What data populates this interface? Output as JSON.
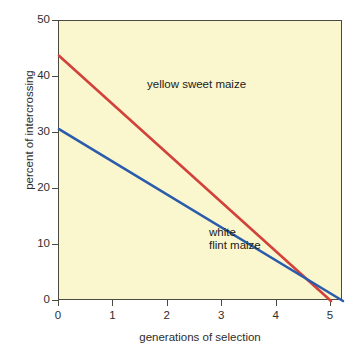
{
  "chart_data": {
    "type": "line",
    "title": "",
    "subtitle": "",
    "xlabel": "generations of selection",
    "ylabel": "percent of intercrossing",
    "xlim": [
      0,
      5.22
    ],
    "ylim": [
      0,
      50
    ],
    "xticks": [
      "0",
      "1",
      "2",
      "3",
      "4",
      "5"
    ],
    "xtick_values": [
      0,
      1,
      2,
      3,
      4,
      5
    ],
    "yticks": [
      "0",
      "10",
      "20",
      "30",
      "40",
      "50"
    ],
    "ytick_values": [
      0,
      10,
      20,
      30,
      40,
      50
    ],
    "grid": false,
    "legend": "inline-annotations",
    "background_color": "#faf6ce",
    "axis_color": "#4a4a42",
    "series": [
      {
        "name": "yellow sweet maize",
        "color": "#d2423a",
        "label_x": 0.55,
        "label_y": 45.0,
        "x": [
          0,
          5.0
        ],
        "values": [
          43.8,
          0
        ]
      },
      {
        "name": "white flint maize",
        "color": "#2b5cab",
        "label_x": 1.7,
        "label_y": 17.0,
        "x": [
          0,
          5.22
        ],
        "values": [
          30.7,
          0
        ]
      }
    ],
    "annotations": [
      {
        "text": "yellow sweet maize",
        "series": "yellow sweet maize"
      },
      {
        "text": "white\nflint maize",
        "series": "white flint maize"
      }
    ]
  },
  "annotations": {
    "yellow_sweet_maize": "yellow sweet maize",
    "white_flint_maize_line1": "white",
    "white_flint_maize_line2": "flint maize"
  }
}
